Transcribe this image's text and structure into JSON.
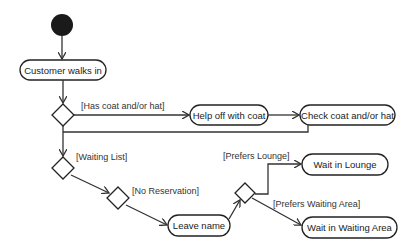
{
  "diagram": {
    "type": "UML activity diagram",
    "start_node": {
      "label": ""
    },
    "activities": [
      {
        "id": "walks_in",
        "label": "Customer walks in"
      },
      {
        "id": "help_off",
        "label": "Help off with coat"
      },
      {
        "id": "check_coat",
        "label": "Check coat and/or hat"
      },
      {
        "id": "leave_name",
        "label": "Leave name"
      },
      {
        "id": "wait_lounge",
        "label": "Wait in Lounge"
      },
      {
        "id": "wait_area",
        "label": "Wait in Waiting Area"
      }
    ],
    "guards": {
      "has_coat": "[Has coat and/or hat]",
      "waiting_list": "[Waiting List]",
      "no_reservation": "[No Reservation]",
      "prefers_lounge": "[Prefers Lounge]",
      "prefers_area": "[Prefers Waiting Area]"
    },
    "colors": {
      "stroke": "#222222",
      "start_fill": "#1a1a1a",
      "background": "#ffffff"
    }
  }
}
